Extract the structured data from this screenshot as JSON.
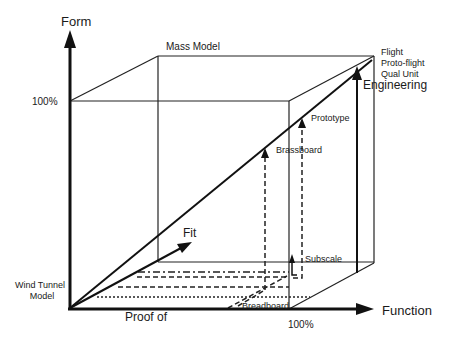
{
  "diagram": {
    "axes": {
      "vertical_label": "Form",
      "vertical_max": "100%",
      "horizontal_label": "Function",
      "horizontal_max": "100%",
      "horizontal_origin_label": "Proof of",
      "depth_label": "Fit"
    },
    "milestones": {
      "mass_model": "Mass Model",
      "flight": "Flight",
      "proto_flight": "Proto-flight",
      "qual_unit": "Qual Unit",
      "engineering": "Engineering",
      "prototype": "Prototype",
      "brassboard": "Brassboard",
      "subscale": "Subscale",
      "breadboard": "Breadboard",
      "wind_tunnel_line1": "Wind Tunnel",
      "wind_tunnel_line2": "Model"
    },
    "marker_icon": "asterisk",
    "colors": {
      "background": "#ffffff",
      "ink": "#111111"
    }
  }
}
